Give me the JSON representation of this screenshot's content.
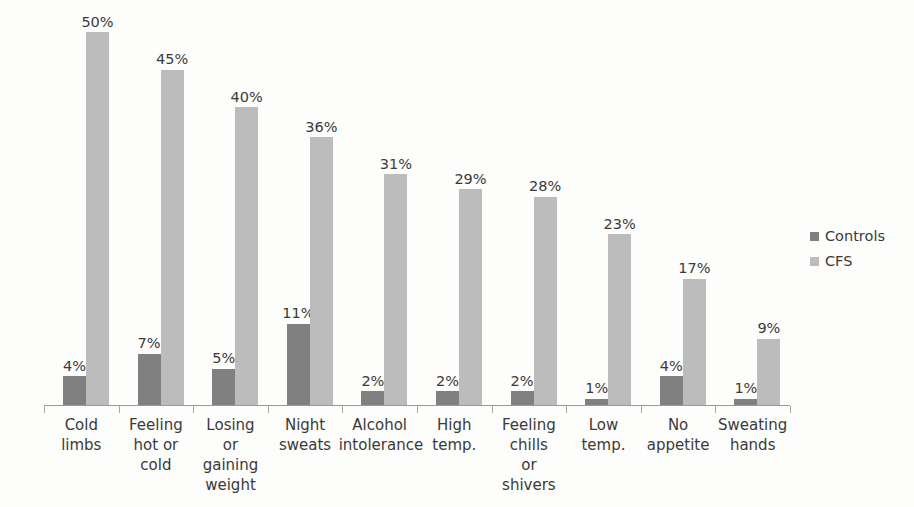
{
  "chart_data": {
    "type": "bar",
    "title": "",
    "subtitle": "",
    "xlabel": "",
    "ylabel": "",
    "ylim": [
      0,
      53
    ],
    "grid": false,
    "legend_position": "right",
    "categories": [
      "Cold limbs",
      "Feeling hot or cold",
      "Losing or gaining weight",
      "Night sweats",
      "Alcohol intolerance",
      "High temp.",
      "Feeling chills or shivers",
      "Low temp.",
      "No appetite",
      "Sweating hands"
    ],
    "category_lines": [
      [
        "Cold",
        "limbs"
      ],
      [
        "Feeling",
        "hot or",
        "cold"
      ],
      [
        "Losing",
        "or",
        "gaining",
        "weight"
      ],
      [
        "Night",
        "sweats"
      ],
      [
        "Alcohol",
        "intolerance"
      ],
      [
        "High",
        "temp."
      ],
      [
        "Feeling",
        "chills",
        "or",
        "shivers"
      ],
      [
        "Low",
        "temp."
      ],
      [
        "No",
        "appetite"
      ],
      [
        "Sweating",
        "hands"
      ]
    ],
    "series": [
      {
        "name": "Controls",
        "color": "#808080",
        "values": [
          4,
          7,
          5,
          11,
          2,
          2,
          2,
          1,
          4,
          1
        ],
        "labels": [
          "4%",
          "7%",
          "5%",
          "11%",
          "2%",
          "2%",
          "2%",
          "1%",
          "4%",
          "1%"
        ]
      },
      {
        "name": "CFS",
        "color": "#bcbcbc",
        "values": [
          50,
          45,
          40,
          36,
          31,
          29,
          28,
          23,
          17,
          9
        ],
        "labels": [
          "50%",
          "45%",
          "40%",
          "36%",
          "31%",
          "29%",
          "28%",
          "23%",
          "17%",
          "9%"
        ]
      }
    ]
  },
  "legend": {
    "items": [
      {
        "label": "Controls",
        "color": "#808080"
      },
      {
        "label": "CFS",
        "color": "#bcbcbc"
      }
    ]
  }
}
